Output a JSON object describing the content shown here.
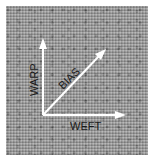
{
  "diagram": {
    "labels": {
      "warp": "WARP",
      "bias": "BIAS",
      "weft": "WEFT"
    },
    "colors": {
      "arrow": "#ffffff",
      "text": "#1a1a1a",
      "fabric": "#9a9a9a"
    }
  }
}
